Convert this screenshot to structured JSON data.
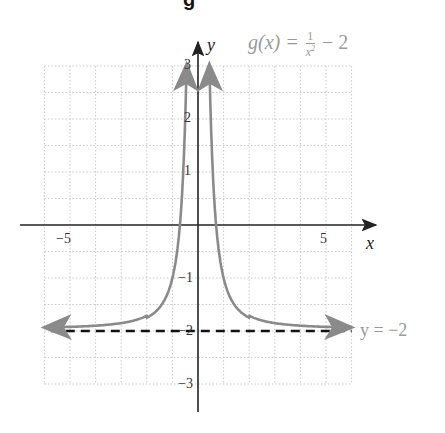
{
  "header": {
    "cut_title_fragment": "g"
  },
  "chart_data": {
    "type": "line",
    "title": "",
    "function_label": "g(x) = 1/x^2 - 2",
    "function_parts": {
      "lhs": "g(x) =",
      "numerator": "1",
      "denominator": "x2",
      "rhs": "− 2"
    },
    "xlabel": "x",
    "ylabel": "y",
    "xlim": [
      -6,
      6
    ],
    "ylim": [
      -3,
      3
    ],
    "grid": true,
    "grid_x_step": 1,
    "grid_y_step": 0.5,
    "x_ticks": [
      {
        "value": -5,
        "label": "−5"
      },
      {
        "value": 5,
        "label": "5"
      }
    ],
    "y_ticks": [
      {
        "value": 3,
        "label": "3"
      },
      {
        "value": 2,
        "label": "2"
      },
      {
        "value": 1,
        "label": "1"
      },
      {
        "value": -1,
        "label": "−1"
      },
      {
        "value": -2,
        "label": "−2"
      },
      {
        "value": -3,
        "label": "−3"
      }
    ],
    "series": [
      {
        "name": "g(x) = 1/x^2 - 2 (left branch)",
        "color": "#8a8a8a",
        "x": [
          -6,
          -5,
          -4,
          -3,
          -2,
          -1.5,
          -1,
          -0.8,
          -0.7,
          -0.6,
          -0.5,
          -0.447
        ],
        "y": [
          -1.97,
          -1.96,
          -1.94,
          -1.89,
          -1.75,
          -1.56,
          -1.0,
          -0.44,
          0.04,
          0.78,
          2.0,
          3.0
        ]
      },
      {
        "name": "g(x) = 1/x^2 - 2 (right branch)",
        "color": "#8a8a8a",
        "x": [
          0.447,
          0.5,
          0.6,
          0.7,
          0.8,
          1,
          1.5,
          2,
          3,
          4,
          5,
          6
        ],
        "y": [
          3.0,
          2.0,
          0.78,
          0.04,
          -0.44,
          -1.0,
          -1.56,
          -1.75,
          -1.89,
          -1.94,
          -1.96,
          -1.97
        ]
      }
    ],
    "asymptote": {
      "type": "horizontal",
      "y": -2,
      "style": "dashed",
      "color": "#111111",
      "label": "y = −2"
    },
    "colors": {
      "curve": "#8a8a8a",
      "axes": "#222222",
      "grid": "#c8c8c8",
      "annotation": "#9a9a9a"
    }
  }
}
